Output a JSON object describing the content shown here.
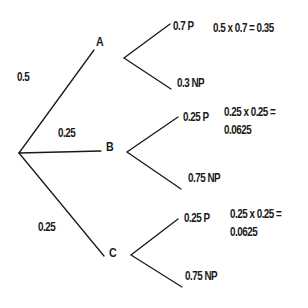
{
  "diagram": {
    "type": "probability-tree",
    "root": {
      "branches": [
        {
          "node": "A",
          "probability": "0.5",
          "outcomes": [
            {
              "label": "0.7 P"
            },
            {
              "label": "0.3 NP"
            }
          ],
          "calculation": {
            "line1": "0.5 x 0.7 = 0.35",
            "line2": ""
          }
        },
        {
          "node": "B",
          "probability": "0.25",
          "outcomes": [
            {
              "label": "0.25 P"
            },
            {
              "label": "0.75 NP"
            }
          ],
          "calculation": {
            "line1": "0.25 x 0.25 =",
            "line2": "0.0625"
          }
        },
        {
          "node": "C",
          "probability": "0.25",
          "outcomes": [
            {
              "label": "0.25 P"
            },
            {
              "label": "0.75 NP"
            }
          ],
          "calculation": {
            "line1": "0.25 x 0.25 =",
            "line2": "0.0625"
          }
        }
      ]
    },
    "line_color": "#1a1a1a"
  }
}
